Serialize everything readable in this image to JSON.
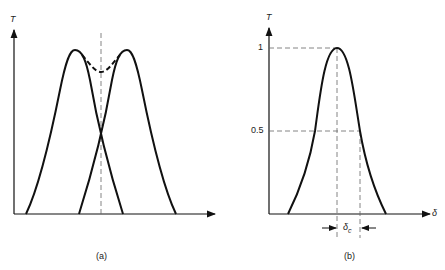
{
  "panels": [
    {
      "id": "a",
      "caption": "(a)",
      "y_axis_label": "T",
      "curves": [
        {
          "name": "left transmission peak",
          "style": "solid",
          "peak_x": 75
        },
        {
          "name": "right transmission peak",
          "style": "solid",
          "peak_x": 125
        },
        {
          "name": "combined envelope",
          "style": "dashed"
        }
      ],
      "center_line": "dashed vertical"
    },
    {
      "id": "b",
      "caption": "(b)",
      "y_axis_label": "T",
      "x_axis_label": "δ",
      "y_ticks": [
        "1",
        "0.5"
      ],
      "width_label_main": "δ",
      "width_label_sub": "c"
    }
  ],
  "colors": {
    "ink": "#111111",
    "background": "#ffffff"
  }
}
